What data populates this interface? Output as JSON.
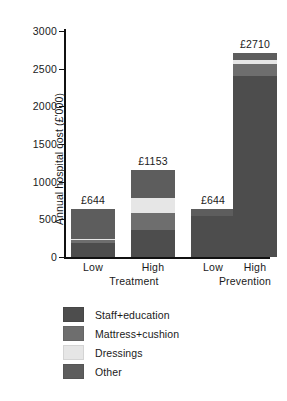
{
  "chart_data": {
    "type": "bar",
    "subtype": "stacked",
    "title": "",
    "xlabel": "",
    "ylabel": "Annual hospital cost (£'000)",
    "ylim": [
      0,
      3000
    ],
    "yticks": [
      0,
      500,
      1000,
      1500,
      2000,
      2500,
      3000
    ],
    "ytick_labels": [
      "0",
      "500",
      "1000",
      "1500",
      "2000",
      "2500",
      "3000"
    ],
    "grid": false,
    "legend_position": "below-left",
    "categories": [
      "Low",
      "High",
      "Low",
      "High"
    ],
    "groups": [
      {
        "name": "Treatment",
        "categories": [
          "Low",
          "High"
        ]
      },
      {
        "name": "Prevention",
        "categories": [
          "Low",
          "High"
        ]
      }
    ],
    "series": [
      {
        "name": "Staff+education",
        "color": "#4d4d4d",
        "values": [
          190,
          360,
          545,
          2400
        ]
      },
      {
        "name": "Mattress+cushion",
        "color": "#6e6e6e",
        "values": [
          34,
          220,
          0,
          160
        ]
      },
      {
        "name": "Dressings",
        "color": "#e6e6e6",
        "values": [
          20,
          205,
          0,
          55
        ]
      },
      {
        "name": "Other",
        "color": "#5d5d5d",
        "values": [
          400,
          368,
          99,
          95
        ]
      }
    ],
    "bar_totals": [
      644,
      1153,
      644,
      2710
    ],
    "bar_total_labels": [
      "£644",
      "£1153",
      "£644",
      "£2710"
    ],
    "legend": [
      {
        "label": "Staff+education",
        "color": "#4d4d4d"
      },
      {
        "label": "Mattress+cushion",
        "color": "#6e6e6e"
      },
      {
        "label": "Dressings",
        "color": "#e6e6e6"
      },
      {
        "label": "Other",
        "color": "#5d5d5d"
      }
    ]
  }
}
